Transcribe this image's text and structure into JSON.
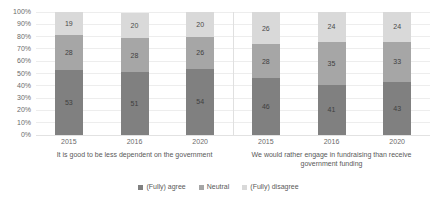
{
  "chart_data": {
    "type": "bar",
    "subtype": "stacked-percentage",
    "title": "",
    "xlabel": "",
    "ylabel": "",
    "ylim": [
      0,
      100
    ],
    "y_ticks": [
      "0%",
      "10%",
      "20%",
      "30%",
      "40%",
      "50%",
      "60%",
      "70%",
      "80%",
      "90%",
      "100%"
    ],
    "grid": true,
    "legend_position": "bottom",
    "colors": {
      "agree": "#808080",
      "neutral": "#a6a6a6",
      "disagree": "#d9d9d9"
    },
    "series": [
      {
        "name": "(Fully) agree",
        "color": "#808080",
        "values": [
          53,
          51,
          54,
          46,
          41,
          43
        ]
      },
      {
        "name": "Neutral",
        "color": "#a6a6a6",
        "values": [
          28,
          28,
          26,
          28,
          35,
          33
        ]
      },
      {
        "name": "(Fully) disagree",
        "color": "#d9d9d9",
        "values": [
          19,
          20,
          20,
          26,
          24,
          24
        ]
      }
    ],
    "categories": [
      "2015",
      "2016",
      "2020",
      "2015",
      "2016",
      "2020"
    ],
    "groups": [
      {
        "label": "It is good to be less dependent on the government",
        "bars": [
          {
            "year": "2015",
            "agree": 53,
            "neutral": 28,
            "disagree": 19
          },
          {
            "year": "2016",
            "agree": 51,
            "neutral": 28,
            "disagree": 20
          },
          {
            "year": "2020",
            "agree": 54,
            "neutral": 26,
            "disagree": 20
          }
        ]
      },
      {
        "label": "We would rather engage in fundraising than receive government funding",
        "bars": [
          {
            "year": "2015",
            "agree": 46,
            "neutral": 28,
            "disagree": 26
          },
          {
            "year": "2016",
            "agree": 41,
            "neutral": 35,
            "disagree": 24
          },
          {
            "year": "2020",
            "agree": 43,
            "neutral": 33,
            "disagree": 24
          }
        ]
      }
    ],
    "legend": [
      {
        "label": "(Fully) agree",
        "color": "#808080"
      },
      {
        "label": "Neutral",
        "color": "#a6a6a6"
      },
      {
        "label": "(Fully) disagree",
        "color": "#d9d9d9"
      }
    ]
  }
}
